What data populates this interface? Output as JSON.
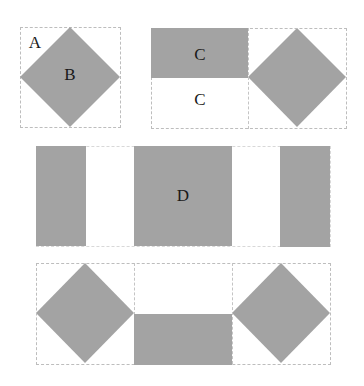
{
  "diagram": {
    "fill_color": "#a3a3a3",
    "border_color": "#bdbdbd",
    "background": "#ffffff",
    "labels": {
      "a": "A",
      "b": "B",
      "c_top": "C",
      "c_bottom": "C",
      "d": "D"
    },
    "panels": [
      {
        "id": "panel-1",
        "description": "square with rotated grey diamond",
        "labels": [
          "A",
          "B"
        ]
      },
      {
        "id": "panel-2",
        "description": "two squares: left with grey top half, right with grey diamond",
        "labels": [
          "C",
          "C"
        ]
      },
      {
        "id": "panel-3",
        "description": "strip: grey, white, grey square, white, grey",
        "labels": [
          "D"
        ]
      },
      {
        "id": "panel-4",
        "description": "three squares: diamond, grey bottom half, diamond",
        "labels": []
      }
    ]
  }
}
